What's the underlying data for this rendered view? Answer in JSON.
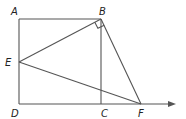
{
  "diagram": {
    "type": "geometry",
    "points": {
      "A": {
        "x": 19,
        "y": 19,
        "label": "A",
        "lx": 12,
        "ly": 15
      },
      "B": {
        "x": 101,
        "y": 19,
        "label": "B",
        "lx": 101,
        "ly": 15
      },
      "C": {
        "x": 101,
        "y": 104,
        "label": "C",
        "lx": 101,
        "ly": 116
      },
      "D": {
        "x": 19,
        "y": 104,
        "label": "D",
        "lx": 12,
        "ly": 116
      },
      "E": {
        "x": 19,
        "y": 62,
        "label": "E",
        "lx": 8,
        "ly": 66
      },
      "F": {
        "x": 141,
        "y": 104,
        "label": "F",
        "lx": 138,
        "ly": 116
      }
    },
    "segments": [
      [
        "A",
        "B"
      ],
      [
        "A",
        "D"
      ],
      [
        "B",
        "C"
      ],
      [
        "D",
        "C"
      ],
      [
        "B",
        "E"
      ],
      [
        "B",
        "F"
      ],
      [
        "E",
        "F"
      ]
    ],
    "ray": {
      "from": "D",
      "to_x": 175,
      "y": 104
    },
    "right_angle_at": "B",
    "colors": {
      "line": "#555555",
      "label": "#222222"
    }
  }
}
